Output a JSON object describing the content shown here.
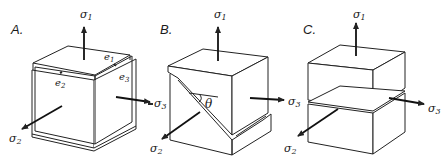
{
  "figure": {
    "panels": [
      {
        "label": "A.",
        "description": "Cube under principal stresses with strain components",
        "stresses": {
          "s1": "σ",
          "s1_sub": "1",
          "s2": "σ",
          "s2_sub": "2",
          "s3": "σ",
          "s3_sub": "3"
        },
        "strains": {
          "e1": "e",
          "e1_sub": "1",
          "e2": "e",
          "e2_sub": "2",
          "e3": "e",
          "e3_sub": "3"
        }
      },
      {
        "label": "B.",
        "description": "Cube with inclined shear fracture at angle theta",
        "stresses": {
          "s1": "σ",
          "s1_sub": "1",
          "s2": "σ",
          "s2_sub": "2",
          "s3": "σ",
          "s3_sub": "3"
        },
        "angle": "θ"
      },
      {
        "label": "C.",
        "description": "Cube split by horizontal fracture",
        "stresses": {
          "s1": "σ",
          "s1_sub": "1",
          "s2": "σ",
          "s2_sub": "2",
          "s3": "σ",
          "s3_sub": "3"
        }
      }
    ],
    "colors": {
      "line": "#222222",
      "background": "#ffffff"
    }
  }
}
